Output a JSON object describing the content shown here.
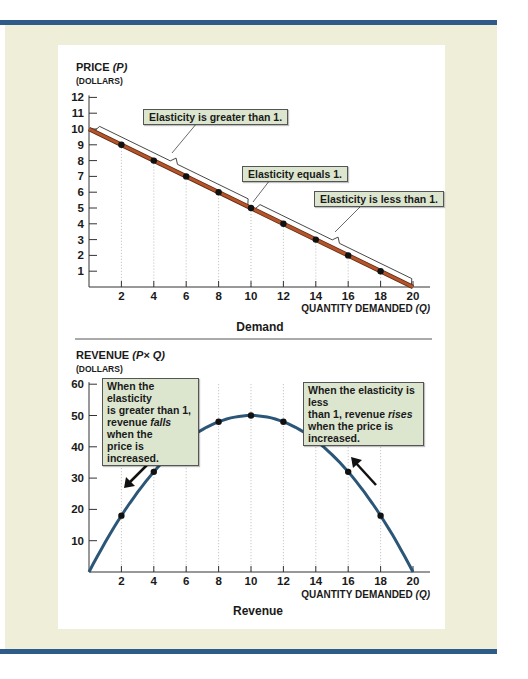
{
  "colors": {
    "frame_bar": "#2f5b88",
    "frame_background": "#eeeed9",
    "panel": "#ffffff",
    "demand_line": "#b5532a",
    "revenue_curve": "#2c5677",
    "note_fill": "#dce6cf",
    "points": "#111111"
  },
  "demand_panel": {
    "y_title_main": "PRICE",
    "y_title_var": "(P)",
    "y_units": "(DOLLARS)",
    "x_title_main": "QUANTITY DEMANDED",
    "x_title_var": "(Q)",
    "caption": "Demand",
    "notes": {
      "greater": "Elasticity is greater than 1.",
      "equals": "Elasticity equals 1.",
      "less": "Elasticity is less than 1."
    }
  },
  "revenue_panel": {
    "y_title_main": "REVENUE",
    "y_title_var": "(P× Q)",
    "y_units": "(DOLLARS)",
    "x_title_main": "QUANTITY DEMANDED",
    "x_title_var": "(Q)",
    "caption": "Revenue",
    "notes": {
      "left_1": "When the elasticity",
      "left_2": "is greater than 1,",
      "left_3a": "revenue ",
      "left_3b": "falls",
      "left_3c": " when the",
      "left_4": "price is increased.",
      "right_1": "When the elasticity is less",
      "right_2a": "than 1, revenue ",
      "right_2b": "rises",
      "right_3": "when the price is increased."
    }
  },
  "chart_data": [
    {
      "type": "line",
      "title": "Demand",
      "xlabel": "Quantity demanded (Q)",
      "ylabel": "Price (P) (dollars)",
      "xlim": [
        0,
        20
      ],
      "ylim": [
        0,
        12
      ],
      "x_ticks": [
        2,
        4,
        6,
        8,
        10,
        12,
        14,
        16,
        18,
        20
      ],
      "y_ticks": [
        1,
        2,
        3,
        4,
        5,
        6,
        7,
        8,
        9,
        10,
        11,
        12
      ],
      "grid": "vertical dotted lines at x ticks",
      "series": [
        {
          "name": "Demand",
          "x": [
            0,
            20
          ],
          "y": [
            10,
            0
          ]
        },
        {
          "name": "Points",
          "x": [
            2,
            4,
            6,
            8,
            10,
            12,
            14,
            16,
            18
          ],
          "y": [
            9,
            8,
            7,
            6,
            5,
            4,
            3,
            2,
            1
          ]
        }
      ],
      "annotations": [
        {
          "text": "Elasticity is greater than 1.",
          "range_x": [
            0,
            10
          ]
        },
        {
          "text": "Elasticity equals 1.",
          "at_x": 10
        },
        {
          "text": "Elasticity is less than 1.",
          "range_x": [
            10,
            20
          ]
        }
      ]
    },
    {
      "type": "line",
      "title": "Revenue",
      "xlabel": "Quantity demanded (Q)",
      "ylabel": "Revenue (P × Q) (dollars)",
      "xlim": [
        0,
        20
      ],
      "ylim": [
        0,
        60
      ],
      "x_ticks": [
        2,
        4,
        6,
        8,
        10,
        12,
        14,
        16,
        18,
        20
      ],
      "y_ticks": [
        10,
        20,
        30,
        40,
        50,
        60
      ],
      "grid": "vertical dotted lines at x ticks",
      "series": [
        {
          "name": "Revenue",
          "x": [
            0,
            2,
            4,
            6,
            8,
            10,
            12,
            14,
            16,
            18,
            20
          ],
          "y": [
            0,
            18,
            32,
            42,
            48,
            50,
            48,
            42,
            32,
            18,
            0
          ]
        }
      ],
      "annotations": [
        {
          "text": "When the elasticity is greater than 1, revenue falls when the price is increased.",
          "arrow": "down-left along curve near Q=3"
        },
        {
          "text": "When the elasticity is less than 1, revenue rises when the price is increased.",
          "arrow": "up-left along curve near Q=17"
        }
      ]
    }
  ]
}
